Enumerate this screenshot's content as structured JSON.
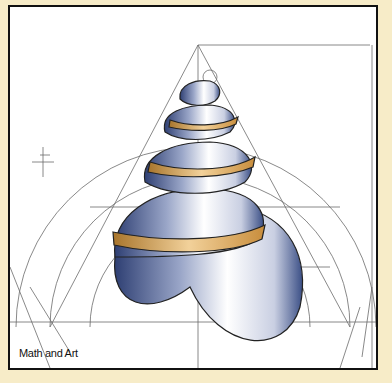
{
  "caption": "Math and Art",
  "colors": {
    "background": "#f7ecc8",
    "frame_border": "#111111",
    "canvas": "#ffffff",
    "shell_blue": "#3b4f86",
    "shell_gold": "#d9a44e",
    "guide_lines": "#6b6b6b"
  },
  "illustration": {
    "subject": "spiral-seashell-geometric-construction",
    "elements": [
      "triangle",
      "semicircles",
      "golden-rectangles",
      "spiral-shell",
      "crosshair-marks"
    ]
  }
}
